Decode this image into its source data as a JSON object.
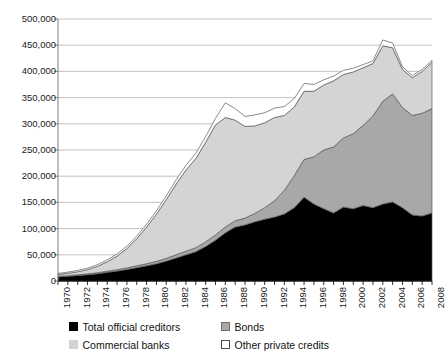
{
  "chart_data": {
    "type": "area",
    "stacked": true,
    "title": "",
    "subtitle": "",
    "xlabel": "",
    "ylabel": "",
    "grid": true,
    "legend_position": "bottom",
    "xlim": [
      1970,
      2008
    ],
    "ylim": [
      0,
      500000
    ],
    "ytick_step": 50000,
    "xtick_step": 2,
    "x": [
      1970,
      1971,
      1972,
      1973,
      1974,
      1975,
      1976,
      1977,
      1978,
      1979,
      1980,
      1981,
      1982,
      1983,
      1984,
      1985,
      1986,
      1987,
      1988,
      1989,
      1990,
      1991,
      1992,
      1993,
      1994,
      1995,
      1996,
      1997,
      1998,
      1999,
      2000,
      2001,
      2002,
      2003,
      2004,
      2005,
      2006,
      2007,
      2008
    ],
    "categories": [
      "1970",
      "1971",
      "1972",
      "1973",
      "1974",
      "1975",
      "1976",
      "1977",
      "1978",
      "1979",
      "1980",
      "1981",
      "1982",
      "1983",
      "1984",
      "1985",
      "1986",
      "1987",
      "1988",
      "1989",
      "1990",
      "1991",
      "1992",
      "1993",
      "1994",
      "1995",
      "1996",
      "1997",
      "1998",
      "1999",
      "2000",
      "2001",
      "2002",
      "2003",
      "2004",
      "2005",
      "2006",
      "2007",
      "2008"
    ],
    "xtick_labels": [
      "1970",
      "1972",
      "1974",
      "1976",
      "1978",
      "1980",
      "1982",
      "1984",
      "1986",
      "1988",
      "1990",
      "1992",
      "1994",
      "1996",
      "1998",
      "2000",
      "2002",
      "2004",
      "2006",
      "2008"
    ],
    "ytick_labels": [
      "0",
      "50,000",
      "100,000",
      "150,000",
      "200,000",
      "250,000",
      "300,000",
      "350,000",
      "400,000",
      "450,000",
      "500,000"
    ],
    "ytick_values": [
      0,
      50000,
      100000,
      150000,
      200000,
      250000,
      300000,
      350000,
      400000,
      450000,
      500000
    ],
    "series": [
      {
        "name": "Total official creditors",
        "color": "#000000",
        "values": [
          8000,
          9000,
          10500,
          12000,
          14000,
          16500,
          19000,
          22000,
          25500,
          29000,
          33000,
          38000,
          44000,
          50000,
          56000,
          66000,
          78000,
          92000,
          103000,
          107000,
          113000,
          118000,
          122000,
          128000,
          140000,
          160000,
          147000,
          138000,
          130000,
          141000,
          138000,
          144000,
          140000,
          147000,
          151000,
          140000,
          126000,
          124000,
          130000
        ]
      },
      {
        "name": "Bonds",
        "color": "#a8a8a8",
        "values": [
          1000,
          1200,
          1400,
          1600,
          1900,
          2200,
          2500,
          2900,
          3400,
          3900,
          4500,
          5200,
          6000,
          6800,
          7600,
          8600,
          9800,
          11000,
          12000,
          13000,
          16000,
          22000,
          31000,
          45000,
          61000,
          72000,
          90000,
          112000,
          126000,
          132000,
          143000,
          153000,
          175000,
          196000,
          206000,
          191000,
          190000,
          196000,
          199000
        ]
      },
      {
        "name": "Commercial banks",
        "color": "#d4d4d4",
        "values": [
          3500,
          4500,
          5800,
          8000,
          12000,
          18000,
          26000,
          37000,
          52000,
          70000,
          90000,
          112000,
          135000,
          155000,
          170000,
          190000,
          210000,
          209000,
          192000,
          175000,
          167000,
          162000,
          159000,
          143000,
          131000,
          130000,
          125000,
          124000,
          126000,
          121000,
          118000,
          110000,
          100000,
          106000,
          88000,
          73000,
          72000,
          80000,
          88000
        ]
      },
      {
        "name": "Other private credits",
        "color": "#ffffff",
        "values": [
          2000,
          2200,
          2500,
          2800,
          3200,
          3600,
          4000,
          4500,
          5000,
          5500,
          6200,
          7000,
          8000,
          9000,
          10000,
          11000,
          12500,
          28000,
          22000,
          19000,
          21000,
          19000,
          18000,
          17000,
          16000,
          15000,
          13000,
          10000,
          9000,
          8000,
          7000,
          6000,
          5000,
          11000,
          9000,
          5000,
          4000,
          4000,
          4000
        ]
      }
    ],
    "axis_color": "#808080",
    "grid_color": "#b3b3b3",
    "line_color": "#595959",
    "background": "#ffffff"
  },
  "legend": {
    "items": [
      {
        "label": "Total official creditors",
        "swatch": "official"
      },
      {
        "label": "Bonds",
        "swatch": "bonds"
      },
      {
        "label": "Commercial banks",
        "swatch": "banks"
      },
      {
        "label": "Other private credits",
        "swatch": "other"
      }
    ]
  }
}
